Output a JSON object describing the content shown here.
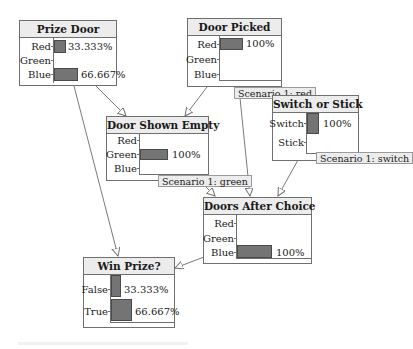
{
  "diagram": {
    "type": "bayesian-network",
    "nodes": [
      {
        "id": "prize_door",
        "title": "Prize Door",
        "states": [
          {
            "label": "Red",
            "value": "33.333%",
            "p": 0.33333
          },
          {
            "label": "Green",
            "value": "",
            "p": 0
          },
          {
            "label": "Blue",
            "value": "66.667%",
            "p": 0.66667
          }
        ]
      },
      {
        "id": "door_picked",
        "title": "Door Picked",
        "states": [
          {
            "label": "Red",
            "value": "100%",
            "p": 1.0
          },
          {
            "label": "Green",
            "value": "",
            "p": 0
          },
          {
            "label": "Blue",
            "value": "",
            "p": 0
          }
        ],
        "scenario": "Scenario 1: red"
      },
      {
        "id": "switch_or_stick",
        "title": "Switch or Stick",
        "states": [
          {
            "label": "Switch",
            "value": "100%",
            "p": 1.0
          },
          {
            "label": "Stick",
            "value": "",
            "p": 0
          }
        ],
        "scenario": "Scenario 1: switch"
      },
      {
        "id": "door_shown_empty",
        "title": "Door Shown Empty",
        "states": [
          {
            "label": "Red",
            "value": "",
            "p": 0
          },
          {
            "label": "Green",
            "value": "100%",
            "p": 1.0
          },
          {
            "label": "Blue",
            "value": "",
            "p": 0
          }
        ],
        "scenario": "Scenario 1: green"
      },
      {
        "id": "doors_after_choice",
        "title": "Doors After Choice",
        "states": [
          {
            "label": "Red",
            "value": "",
            "p": 0
          },
          {
            "label": "Green",
            "value": "",
            "p": 0
          },
          {
            "label": "Blue",
            "value": "100%",
            "p": 1.0
          }
        ]
      },
      {
        "id": "win_prize",
        "title": "Win Prize?",
        "states": [
          {
            "label": "False",
            "value": "33.333%",
            "p": 0.33333
          },
          {
            "label": "True",
            "value": "66.667%",
            "p": 0.66667
          }
        ]
      }
    ],
    "edges": [
      {
        "from": "prize_door",
        "to": "door_shown_empty"
      },
      {
        "from": "prize_door",
        "to": "win_prize"
      },
      {
        "from": "door_picked",
        "to": "door_shown_empty"
      },
      {
        "from": "door_picked",
        "to": "doors_after_choice"
      },
      {
        "from": "door_shown_empty",
        "to": "doors_after_choice"
      },
      {
        "from": "switch_or_stick",
        "to": "doors_after_choice"
      },
      {
        "from": "doors_after_choice",
        "to": "win_prize"
      }
    ],
    "colors": {
      "bar_fill": "#747474",
      "bar_border": "#4a4a4a",
      "header_bg": "#ececec",
      "border": "#6f6f6f"
    }
  }
}
